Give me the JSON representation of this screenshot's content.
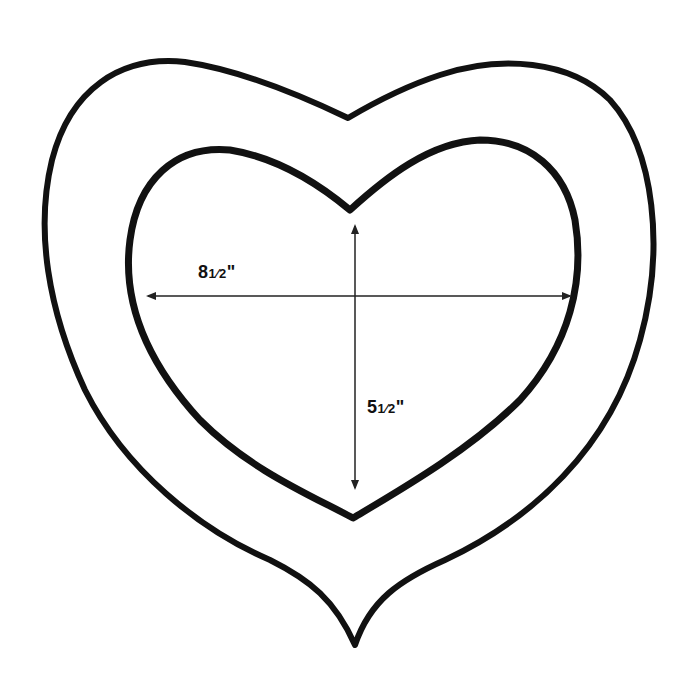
{
  "diagram": {
    "type": "heart-frame-template",
    "colors": {
      "stroke": "#111111",
      "background": "#ffffff"
    },
    "outer_heart": {
      "name": "outer-heart-outline"
    },
    "inner_heart": {
      "name": "inner-heart-outline"
    },
    "dimensions": {
      "width": {
        "label": "8½\"",
        "whole": "8",
        "fraction": "1⁄2",
        "unit": "\""
      },
      "height": {
        "label": "5½\"",
        "whole": "5",
        "fraction": "1⁄2",
        "unit": "\""
      }
    }
  }
}
